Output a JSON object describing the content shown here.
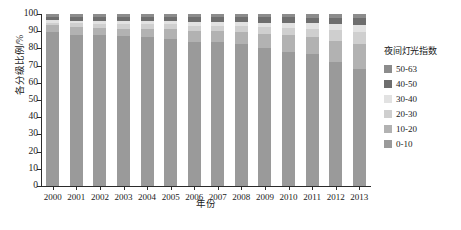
{
  "chart_data": {
    "type": "bar",
    "stacked": true,
    "title": "",
    "xlabel": "年份",
    "ylabel": "各分级比例/%",
    "ylim": [
      0,
      100
    ],
    "yticks": [
      0,
      10,
      20,
      30,
      40,
      50,
      60,
      70,
      80,
      90,
      100
    ],
    "grid": false,
    "legend_position": "right",
    "legend_title": "夜间灯光指数",
    "categories": [
      "2000",
      "2001",
      "2002",
      "2003",
      "2004",
      "2005",
      "2006",
      "2007",
      "2008",
      "2009",
      "2010",
      "2011",
      "2012",
      "2013"
    ],
    "series": [
      {
        "name": "0-10",
        "color": "#9a9a9a",
        "values": [
          89.5,
          88.0,
          87.5,
          87.0,
          86.5,
          85.5,
          84.0,
          83.5,
          82.5,
          80.5,
          78.0,
          76.5,
          72.0,
          68.0
        ]
      },
      {
        "name": "10-20",
        "color": "#b2b2b2",
        "values": [
          4.0,
          4.5,
          4.5,
          4.5,
          5.0,
          5.5,
          6.0,
          6.5,
          7.0,
          8.0,
          9.5,
          10.0,
          12.5,
          14.5
        ]
      },
      {
        "name": "20-30",
        "color": "#cfcfcf",
        "values": [
          1.5,
          2.0,
          2.0,
          2.5,
          2.5,
          3.0,
          3.0,
          3.0,
          3.5,
          4.0,
          4.5,
          5.0,
          6.0,
          7.0
        ]
      },
      {
        "name": "30-40",
        "color": "#e2e2e2",
        "values": [
          1.5,
          1.5,
          2.0,
          2.0,
          2.0,
          2.0,
          2.5,
          2.5,
          2.5,
          2.5,
          3.0,
          3.0,
          3.5,
          4.0
        ]
      },
      {
        "name": "40-50",
        "color": "#6e6e6e",
        "values": [
          2.0,
          2.0,
          2.0,
          2.0,
          2.0,
          2.0,
          2.5,
          2.5,
          2.5,
          3.0,
          3.0,
          3.0,
          3.5,
          4.0
        ]
      },
      {
        "name": "50-63",
        "color": "#8c8c8c",
        "values": [
          1.5,
          2.0,
          2.0,
          2.0,
          2.0,
          2.0,
          2.0,
          2.0,
          2.0,
          2.0,
          2.0,
          2.5,
          2.5,
          2.5
        ]
      }
    ]
  },
  "legend": {
    "title": "夜间灯光指数",
    "items": [
      {
        "label": "50-63",
        "color": "#8c8c8c"
      },
      {
        "label": "40-50",
        "color": "#6e6e6e"
      },
      {
        "label": "30-40",
        "color": "#e2e2e2"
      },
      {
        "label": "20-30",
        "color": "#cfcfcf"
      },
      {
        "label": "10-20",
        "color": "#b2b2b2"
      },
      {
        "label": "0-10",
        "color": "#9a9a9a"
      }
    ]
  },
  "axes": {
    "y_title": "各分级比例/%",
    "x_title": "年份"
  }
}
